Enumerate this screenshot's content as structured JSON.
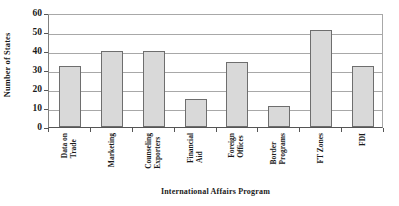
{
  "chart_data": {
    "type": "bar",
    "title": "",
    "xlabel": "International Affairs Program",
    "ylabel": "Number of States",
    "categories": [
      "Data on Trade",
      "Marketing",
      "Counseling Exporters",
      "Financial Aid",
      "Foreign Offices",
      "Border Programs",
      "FT Zones",
      "FDI"
    ],
    "category_lines": [
      [
        "Data on",
        "Trade"
      ],
      [
        "Marketing",
        ""
      ],
      [
        "Counseling",
        "Exporters"
      ],
      [
        "Financial",
        "Aid"
      ],
      [
        "Foreign",
        "Offices"
      ],
      [
        "Border",
        "Programs"
      ],
      [
        "FT Zones",
        ""
      ],
      [
        "FDI",
        ""
      ]
    ],
    "values": [
      32,
      40,
      40,
      15,
      34,
      11,
      51,
      32
    ],
    "ylim": [
      0,
      60
    ],
    "ytick_labels": [
      "60",
      "50",
      "40",
      "30",
      "20",
      "10",
      "0"
    ],
    "ytick_values": [
      60,
      50,
      40,
      30,
      20,
      10,
      0
    ],
    "grid": true,
    "legend": "none",
    "bar_fill_color": "#d9d9d9",
    "bar_edge_color": "#6e6e6e",
    "gridline_color": "#a8a8a8",
    "axis_color": "#555555"
  }
}
